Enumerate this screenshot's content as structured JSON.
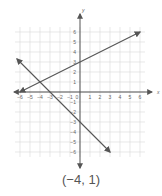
{
  "chart_data": {
    "type": "line",
    "title": "",
    "xlabel": "x",
    "ylabel": "y",
    "xlim": [
      -6,
      6
    ],
    "ylim": [
      -6,
      6
    ],
    "grid": true,
    "x_ticks": [
      -6,
      -5,
      -4,
      -3,
      -2,
      -1,
      0,
      1,
      2,
      3,
      4,
      5,
      6
    ],
    "y_ticks": [
      -6,
      -5,
      -4,
      -3,
      -2,
      -1,
      1,
      2,
      3,
      4,
      5,
      6
    ],
    "series": [
      {
        "name": "line-1",
        "equation": "y = 0.5x + 3",
        "points": [
          [
            -6,
            0
          ],
          [
            0,
            3
          ],
          [
            6,
            6
          ]
        ]
      },
      {
        "name": "line-2",
        "equation": "y = -x - 3",
        "points": [
          [
            -6.3,
            3.3
          ],
          [
            -3,
            0
          ],
          [
            0,
            -3
          ],
          [
            3,
            -6
          ]
        ]
      }
    ],
    "intersection": [
      -4,
      1
    ]
  },
  "caption": "(−4, 1)",
  "colors": {
    "axis": "#555555",
    "grid": "#d8d8d8",
    "line": "#555555",
    "text": "#666666"
  }
}
